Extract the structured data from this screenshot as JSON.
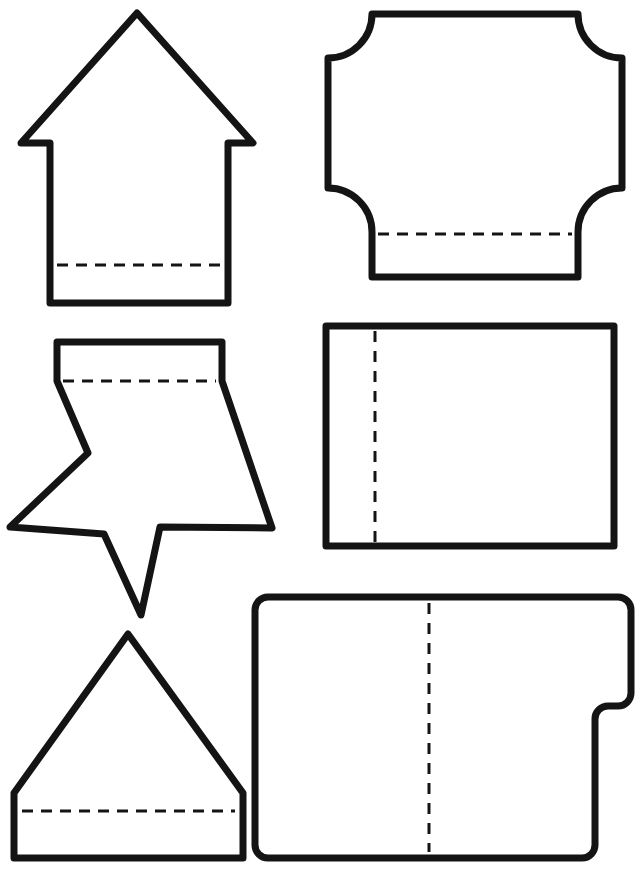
{
  "sheet": {
    "title": "Fold-Tab Shape Template Sheet",
    "width": 638,
    "height": 873,
    "background_color": "#ffffff",
    "outline_color": "#141414",
    "fold_line_color": "#141414",
    "outline_stroke_width": 7,
    "fold_stroke_width": 3,
    "fold_line_style": "dashed",
    "shape_count": 6,
    "columns": 2,
    "rows": 3
  },
  "shapes": [
    {
      "id": "arrow-up",
      "name": "Up Arrow with Bottom Fold Tab",
      "type": "arrow",
      "position": "top-left",
      "fold_line": "horizontal",
      "fold_count": 1,
      "outline_points": "137,13 240,135 228,135 228,303 50,303 50,135 35,135",
      "outline_path": "M137,13 L253,143 L228,143 L228,303 L50,303 L50,143 L21,143 Z",
      "fold_path": "M57,265 L222,265",
      "fold_dash": "11 8",
      "bounds": {
        "x": 14,
        "y": 10,
        "width": 246,
        "height": 297
      }
    },
    {
      "id": "concave-corner-rect",
      "name": "Rectangle with Concave Quarter-Circle Corners and Bottom Fold Tab",
      "type": "notched-rectangle",
      "position": "top-right",
      "fold_line": "horizontal",
      "fold_count": 1,
      "outline_path": "M372,14 L578,14 L578,14 A44,44 0 0 0 622,58 L622,188 A44,44 0 0 0 578,232 L578,277 L372,277 L372,232 A44,44 0 0 0 328,188 L328,58 A44,44 0 0 0 372,14 Z",
      "fold_path": "M378,234 L572,234",
      "fold_dash": "11 8",
      "bounds": {
        "x": 324,
        "y": 10,
        "width": 302,
        "height": 271
      }
    },
    {
      "id": "star-with-tab",
      "name": "Five-Point Star with Top Fold Tab",
      "type": "star",
      "position": "middle-left",
      "points": 5,
      "fold_line": "horizontal",
      "fold_count": 1,
      "outline_path": "M57,342 L222,342 L222,381 L272,528 L160,527 L141,615 L104,534 L10,527 L88,453 L57,381 Z",
      "fold_path": "M63,381 L216,381",
      "fold_dash": "11 8",
      "bounds": {
        "x": 7,
        "y": 338,
        "width": 268,
        "height": 281
      },
      "star_tips": [
        {
          "label": "left-point",
          "x": 10,
          "y": 527
        },
        {
          "label": "right-point",
          "x": 272,
          "y": 528
        },
        {
          "label": "bottom-point",
          "x": 141,
          "y": 615
        }
      ]
    },
    {
      "id": "plain-rectangle",
      "name": "Rectangle with Vertical Left Fold Line",
      "type": "rectangle",
      "position": "middle-right",
      "fold_line": "vertical",
      "fold_count": 1,
      "outline_path": "M326,326 L614,326 L614,546 L326,546 Z",
      "fold_path": "M375,331 L375,542",
      "fold_dash": "11 9",
      "bounds": {
        "x": 322,
        "y": 322,
        "width": 296,
        "height": 228
      }
    },
    {
      "id": "triangle-with-tab",
      "name": "Triangle with Bottom Fold Tab",
      "type": "triangle",
      "position": "bottom-left",
      "fold_line": "horizontal",
      "fold_count": 1,
      "outline_path": "M128,634 L243,793 L243,858 L14,858 L14,793 Z",
      "fold_path": "M22,811 L235,811",
      "fold_dash": "11 8",
      "bounds": {
        "x": 10,
        "y": 630,
        "width": 237,
        "height": 232
      }
    },
    {
      "id": "stepped-rounded-rect",
      "name": "Rounded Rectangle with Right Side Step Notch and Center Fold Line",
      "type": "stepped-rectangle",
      "position": "bottom-right",
      "fold_line": "vertical",
      "fold_count": 1,
      "outline_path": "M268,597 L618,597 A13,13 0 0 1 631,610 L631,693 A13,13 0 0 1 618,706 L608,706 A13,13 0 0 0 595,719 L595,845 A13,13 0 0 1 582,858 L268,858 A13,13 0 0 1 255,845 L255,610 A13,13 0 0 1 268,597 Z",
      "fold_path": "M429,603 L429,852",
      "fold_dash": "11 9",
      "bounds": {
        "x": 251,
        "y": 593,
        "width": 384,
        "height": 269
      }
    }
  ],
  "legend": {
    "solid_line_meaning": "Cut line",
    "dashed_line_meaning": "Fold line"
  }
}
